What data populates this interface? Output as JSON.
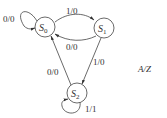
{
  "diagram": {
    "type": "state-machine",
    "legend": "A/Z",
    "states": [
      {
        "id": "S0",
        "name": "S",
        "sub": "0"
      },
      {
        "id": "S1",
        "name": "S",
        "sub": "1"
      },
      {
        "id": "S2",
        "name": "S",
        "sub": "2"
      }
    ],
    "transitions": [
      {
        "from": "S0",
        "to": "S0",
        "label": "0/0"
      },
      {
        "from": "S0",
        "to": "S1",
        "label": "1/0"
      },
      {
        "from": "S1",
        "to": "S0",
        "label": "0/0"
      },
      {
        "from": "S1",
        "to": "S2",
        "label": "1/0"
      },
      {
        "from": "S2",
        "to": "S0",
        "label": "0/0"
      },
      {
        "from": "S2",
        "to": "S2",
        "label": "1/1"
      }
    ]
  }
}
